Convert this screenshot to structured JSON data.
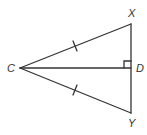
{
  "diagram": {
    "type": "geometry-triangle",
    "stroke_color": "#333333",
    "background": "#ffffff",
    "points": {
      "C": {
        "label": "C",
        "x": 20,
        "y": 68
      },
      "X": {
        "label": "X",
        "x": 131,
        "y": 24
      },
      "D": {
        "label": "D",
        "x": 131,
        "y": 68
      },
      "Y": {
        "label": "Y",
        "x": 131,
        "y": 113
      }
    },
    "segments": [
      "CX",
      "CY",
      "CD",
      "XY"
    ],
    "congruence_marks": [
      "CX",
      "CY"
    ],
    "right_angle_at": "D"
  }
}
